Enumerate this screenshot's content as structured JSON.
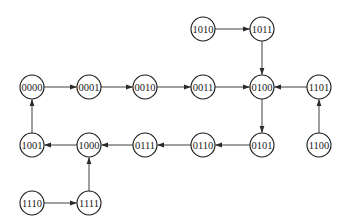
{
  "diagram": {
    "type": "state-transition-graph",
    "node_radius": 12,
    "colors": {
      "stroke": "#1a1a1a",
      "fill": "#ffffff",
      "text": "#1a1a1a",
      "edge": "#2a2a2a"
    },
    "nodes": [
      {
        "id": "1010",
        "label": "1010",
        "x": 203,
        "y": 29
      },
      {
        "id": "1011",
        "label": "1011",
        "x": 262,
        "y": 29
      },
      {
        "id": "0000",
        "label": "0000",
        "x": 32,
        "y": 87
      },
      {
        "id": "0001",
        "label": "0001",
        "x": 89,
        "y": 87
      },
      {
        "id": "0010",
        "label": "0010",
        "x": 145,
        "y": 87
      },
      {
        "id": "0011",
        "label": "0011",
        "x": 203,
        "y": 87
      },
      {
        "id": "0100",
        "label": "0100",
        "x": 262,
        "y": 87
      },
      {
        "id": "1101",
        "label": "1101",
        "x": 319,
        "y": 87
      },
      {
        "id": "1001",
        "label": "1001",
        "x": 32,
        "y": 145
      },
      {
        "id": "1000",
        "label": "1000",
        "x": 89,
        "y": 145
      },
      {
        "id": "0111",
        "label": "0111",
        "x": 145,
        "y": 145
      },
      {
        "id": "0110",
        "label": "0110",
        "x": 203,
        "y": 145
      },
      {
        "id": "0101",
        "label": "0101",
        "x": 262,
        "y": 145
      },
      {
        "id": "1100",
        "label": "1100",
        "x": 319,
        "y": 145
      },
      {
        "id": "1110",
        "label": "1110",
        "x": 32,
        "y": 203
      },
      {
        "id": "1111",
        "label": "1111",
        "x": 89,
        "y": 203
      }
    ],
    "edges": [
      {
        "from": "1010",
        "to": "1011"
      },
      {
        "from": "1011",
        "to": "0100"
      },
      {
        "from": "0000",
        "to": "0001"
      },
      {
        "from": "0001",
        "to": "0010"
      },
      {
        "from": "0010",
        "to": "0011"
      },
      {
        "from": "0011",
        "to": "0100"
      },
      {
        "from": "1101",
        "to": "0100"
      },
      {
        "from": "1100",
        "to": "1101"
      },
      {
        "from": "0100",
        "to": "0101"
      },
      {
        "from": "0101",
        "to": "0110"
      },
      {
        "from": "0110",
        "to": "0111"
      },
      {
        "from": "0111",
        "to": "1000"
      },
      {
        "from": "1000",
        "to": "1001"
      },
      {
        "from": "1001",
        "to": "0000"
      },
      {
        "from": "1111",
        "to": "1000"
      },
      {
        "from": "1110",
        "to": "1111"
      }
    ]
  }
}
